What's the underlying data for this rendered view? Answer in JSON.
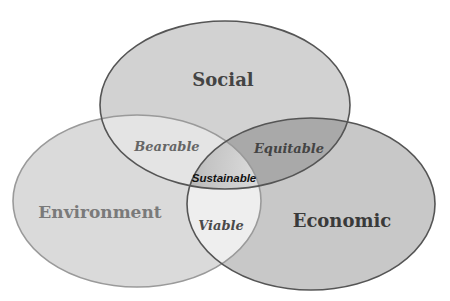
{
  "diagram": {
    "type": "venn-3",
    "sets": {
      "social": {
        "label": "Social",
        "fill": "#d2d2d2",
        "stroke": "#555555",
        "text_color": "#444444"
      },
      "environment": {
        "label": "Environment",
        "fill": "#dadada",
        "stroke": "#9a9a9a",
        "text_color": "#7a7a7a"
      },
      "economic": {
        "label": "Economic",
        "fill": "#c8c8c8",
        "stroke": "#555555",
        "text_color": "#3a3a3a"
      }
    },
    "intersections": {
      "social_environment": {
        "label": "Bearable",
        "fill": "#e4e4e4",
        "text_color": "#666666"
      },
      "social_economic": {
        "label": "Equitable",
        "fill": "#a9a9a9",
        "text_color": "#444444"
      },
      "environment_economic": {
        "label": "Viable",
        "fill": "#eeeeee",
        "text_color": "#4a4a4a"
      },
      "all": {
        "label": "Sustainable",
        "fill": "#c0c0c0",
        "text_color": "#111111"
      }
    }
  }
}
